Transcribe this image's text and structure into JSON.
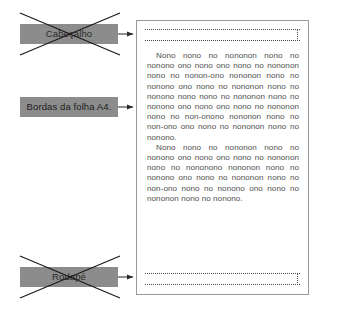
{
  "diagram": {
    "colors": {
      "label_fill": "#8c8c8c",
      "label_text": "#1c1c1c",
      "page_border": "#9a9a9a",
      "body_text": "#4e4e4e",
      "cross_stroke": "#1a1a1a",
      "connector_stroke": "#3a3a3a",
      "dotted_guide": "#4a4a4a",
      "background": "#ffffff"
    }
  },
  "annotations": [
    {
      "id": "cabecalho",
      "label": "Cabeçalho",
      "struck_out": true,
      "icon": "x-cross-icon",
      "arrow": "arrow-right-icon"
    },
    {
      "id": "bordas",
      "label": "Bordas da folha A4.",
      "struck_out": false,
      "icon": null,
      "arrow": "arrow-right-icon"
    },
    {
      "id": "rodape",
      "label": "Rodapé",
      "struck_out": true,
      "icon": "x-cross-icon",
      "arrow": "arrow-right-icon"
    }
  ],
  "page": {
    "header_region": {
      "name": "header-guide",
      "guide_lines": 2,
      "style": "dotted"
    },
    "footer_region": {
      "name": "footer-guide",
      "guide_lines": 2,
      "style": "dotted"
    },
    "body": {
      "paragraphs": [
        "Nono nono no nononon nono no nonono ono nono ono nono no nononon nono no nonon-ono nononon nono no nonono ono nono no nononon nono no nonono nono nono no nononon nono no nonono ono nono ono nono no nononon nono no non-onono nononon nono no non-ono ono nono no nononon nono no nonono.",
        "Nono nono no nononon nono no nonono ono nono ono nono no nononon nono no nononono nononon nono no nonono ono nono no nononon nono no non-ono nono no nonono ono nono no nononon nono no nonono."
      ]
    }
  }
}
